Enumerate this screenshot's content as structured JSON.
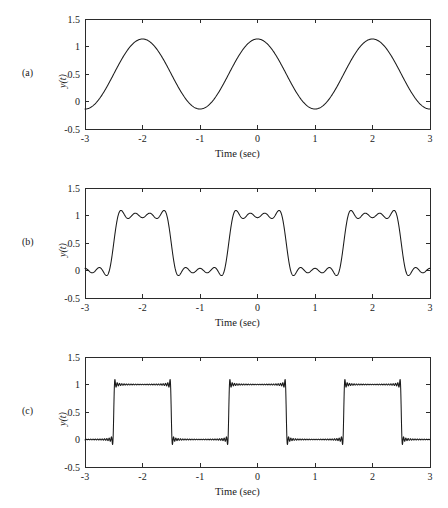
{
  "figure": {
    "background": "#ffffff",
    "line_color": "#1a1a1a",
    "axis_color": "#2b2b2b"
  },
  "panels": [
    {
      "tag": "(a)",
      "ylabel": "y(t)",
      "xlabel": "Time (sec)"
    },
    {
      "tag": "(b)",
      "ylabel": "y(t)",
      "xlabel": "Time (sec)"
    },
    {
      "tag": "(c)",
      "ylabel": "y(t)",
      "xlabel": "Time (sec)"
    }
  ],
  "axes": {
    "xticks": [
      "-3",
      "-2",
      "-1",
      "0",
      "1",
      "2",
      "3"
    ],
    "xtick_values": [
      -3,
      -2,
      -1,
      0,
      1,
      2,
      3
    ],
    "yticks": [
      "1.5",
      "1",
      "0.5",
      "0",
      "-0.5"
    ],
    "ytick_values": [
      1.5,
      1,
      0.5,
      0,
      -0.5
    ],
    "xlim": [
      -3,
      3
    ],
    "ylim": [
      -0.5,
      1.5
    ]
  },
  "chart_data": [
    {
      "type": "line",
      "title": "",
      "panel": "(a)",
      "xlabel": "Time (sec)",
      "ylabel": "y(t)",
      "xlim": [
        -3,
        3
      ],
      "ylim": [
        -0.5,
        1.5
      ],
      "xticks": [
        -3,
        -2,
        -1,
        0,
        1,
        2,
        3
      ],
      "yticks": [
        -0.5,
        0,
        0.5,
        1,
        1.5
      ],
      "grid": false,
      "legend": "none",
      "description": "Fourier series partial sum of a unit-amplitude square wave, period 2 s, 50% duty, using the fundamental harmonic only (N = 1).",
      "series": [
        {
          "name": "N = 1 partial sum",
          "harmonics": 1,
          "dc_offset": 0.5,
          "fundamental_amplitude": 0.23,
          "period": 2.0,
          "min": 0.27,
          "max": 0.73,
          "peaks_at": [
            -1.5,
            0.5,
            2.5
          ],
          "troughs_at": [
            -2.5,
            -0.5,
            1.5
          ],
          "value_at_x_minus3": 0.44,
          "value_at_x_plus3": 0.44
        }
      ]
    },
    {
      "type": "line",
      "title": "",
      "panel": "(b)",
      "xlabel": "Time (sec)",
      "ylabel": "y(t)",
      "xlim": [
        -3,
        3
      ],
      "ylim": [
        -0.5,
        1.5
      ],
      "xticks": [
        -3,
        -2,
        -1,
        0,
        1,
        2,
        3
      ],
      "yticks": [
        -0.5,
        0,
        0.5,
        1,
        1.5
      ],
      "grid": false,
      "legend": "none",
      "description": "Fourier series partial sum with a moderate number of harmonics (N = 7); edges are smoothed with mild rounding, flat tops near 1 and flat bottoms near 0.",
      "series": [
        {
          "name": "N = 7 partial sum",
          "harmonics": 7,
          "dc_offset": 0.5,
          "period": 2.0,
          "low_level": 0.0,
          "high_level": 1.0,
          "rising_edges_at": [
            -2.5,
            -0.5,
            1.5
          ],
          "falling_edges_at": [
            -1.5,
            0.5,
            2.5
          ],
          "min": -0.02,
          "max": 1.0
        }
      ]
    },
    {
      "type": "line",
      "title": "",
      "panel": "(c)",
      "xlabel": "Time (sec)",
      "ylabel": "y(t)",
      "xlim": [
        -3,
        3
      ],
      "ylim": [
        -0.5,
        1.5
      ],
      "xticks": [
        -3,
        -2,
        -1,
        0,
        1,
        2,
        3
      ],
      "yticks": [
        -0.5,
        0,
        0.5,
        1,
        1.5
      ],
      "grid": false,
      "legend": "none",
      "description": "Fourier series partial sum with a large number of harmonics (N = 49); nearly ideal square wave with visible Gibbs phenomenon ringing and overshoot spikes at each discontinuity.",
      "series": [
        {
          "name": "N = 49 partial sum",
          "harmonics": 49,
          "dc_offset": 0.5,
          "period": 2.0,
          "low_level": 0.0,
          "high_level": 1.0,
          "rising_edges_at": [
            -2.5,
            -0.5,
            1.5
          ],
          "falling_edges_at": [
            -1.5,
            0.5,
            2.5
          ],
          "gibbs_overshoot": 0.09,
          "gibbs_undershoot": -0.09,
          "min": -0.09,
          "max": 1.09
        }
      ]
    }
  ]
}
